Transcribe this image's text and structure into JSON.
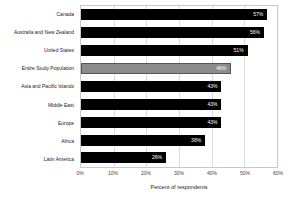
{
  "chart_data": {
    "type": "bar",
    "orientation": "horizontal",
    "title": "",
    "xlabel": "Percent of respondents",
    "ylabel": "",
    "xlim": [
      0,
      60
    ],
    "x_ticks": [
      "0%",
      "10%",
      "20%",
      "30%",
      "40%",
      "50%",
      "60%"
    ],
    "x_tick_values": [
      0,
      10,
      20,
      30,
      40,
      50,
      60
    ],
    "grid": true,
    "legend": "none",
    "categories": [
      "Canada",
      "Australia and New Zealand",
      "United States",
      "Entire Study Population",
      "Asia and Pacific Islands",
      "Middle East",
      "Europe",
      "Africa",
      "Latin America"
    ],
    "values": [
      57,
      56,
      51,
      46,
      43,
      43,
      43,
      38,
      26
    ],
    "data_labels": [
      "57%",
      "56%",
      "51%",
      "46%",
      "43%",
      "43%",
      "43%",
      "38%",
      "26%"
    ],
    "highlight_index": 3,
    "colors": {
      "bar": "#000000",
      "highlight_bar": "#8c8c8c",
      "highlight_border": "#555555",
      "data_label": "#ffffff",
      "grid": "#dcdcdc",
      "frame": "#c8c8c8",
      "background": "#ffffff",
      "text": "#1a1a1a"
    }
  }
}
